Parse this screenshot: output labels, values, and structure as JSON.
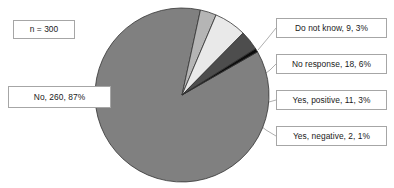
{
  "chart_data": {
    "type": "pie",
    "title": "",
    "subtitle": "",
    "xlabel": "",
    "ylabel": "",
    "grid": false,
    "legend_position": "none",
    "annotation": "n = 300",
    "sample_size": 300,
    "label_format": "category, count, percent",
    "categories": [
      "No",
      "Do not know",
      "No response",
      "Yes, positive",
      "Yes, negative"
    ],
    "values": [
      260,
      9,
      18,
      11,
      2
    ],
    "percents": [
      87,
      3,
      6,
      3,
      1
    ],
    "colors": [
      "#808080",
      "#b5b5b5",
      "#e9e9e9",
      "#4d4d4d",
      "#0d0d0d"
    ],
    "slices": [
      {
        "name": "No",
        "label": "No, 260, 87%",
        "count": 260,
        "percent": 87,
        "color": "#808080"
      },
      {
        "name": "Do not know",
        "label": "Do not know, 9, 3%",
        "count": 9,
        "percent": 3,
        "color": "#b5b5b5"
      },
      {
        "name": "No response",
        "label": "No response, 18, 6%",
        "count": 18,
        "percent": 6,
        "color": "#e9e9e9"
      },
      {
        "name": "Yes, positive",
        "label": "Yes, positive, 11, 3%",
        "count": 11,
        "percent": 3,
        "color": "#4d4d4d"
      },
      {
        "name": "Yes, negative",
        "label": "Yes, negative, 2, 1%",
        "count": 2,
        "percent": 1,
        "color": "#0d0d0d"
      }
    ]
  },
  "annotations": {
    "sample_size": "n = 300"
  },
  "labels": {
    "no": "No, 260, 87%",
    "do_not_know": "Do not know, 9, 3%",
    "no_response": "No response, 18, 6%",
    "yes_positive": "Yes, positive, 11, 3%",
    "yes_negative": "Yes, negative, 2, 1%"
  }
}
